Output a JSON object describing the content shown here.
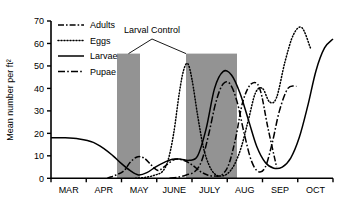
{
  "chart_data": {
    "type": "line",
    "title": "",
    "xlabel": "",
    "ylabel": "Mean number per ft²",
    "ylim": [
      0,
      70
    ],
    "yticks": [
      0,
      10,
      20,
      30,
      40,
      50,
      60,
      70
    ],
    "ytick_labels": [
      "0",
      "10",
      "20",
      "30",
      "40",
      "50",
      "60",
      "70"
    ],
    "categories": [
      "MAR",
      "APR",
      "MAY",
      "JUNE",
      "JULY",
      "AUG",
      "SEP",
      "OCT"
    ],
    "xtick_labels": [
      "MAR",
      "APR",
      "MAY",
      "JUNE",
      "JULY",
      "AUG",
      "SEP",
      "OCT"
    ],
    "grid": false,
    "legend_position": "top-left",
    "legend": [
      "Adults",
      "Eggs",
      "Larvae",
      "Pupae"
    ],
    "annotations": [
      {
        "text": "Larval Control",
        "x": "MAY-JUNE boundary",
        "y": 65
      }
    ],
    "shaded_regions": [
      {
        "label": "Larval Control application 1",
        "x_start": "MAY",
        "x_end": "late MAY",
        "y_top": 57,
        "color": "#939393"
      },
      {
        "label": "Larval Control application 2",
        "x_start": "late JUNE",
        "x_end": "late JULY",
        "y_top": 57,
        "color": "#939393"
      }
    ],
    "series": [
      {
        "name": "Adults",
        "style": "dash-dot",
        "color": "#000000",
        "x": [
          2.0,
          2.55,
          2.8,
          3.05,
          3.3,
          3.55,
          3.8,
          4.1,
          4.4,
          4.7,
          5.0,
          5.3,
          5.55,
          5.8,
          6.05,
          6.3,
          6.55,
          6.8,
          7.1,
          7.4,
          7.7,
          8.0
        ],
        "values": [
          0,
          3,
          7,
          9.5,
          9,
          6,
          3.5,
          6,
          8.5,
          8,
          6,
          3,
          1.5,
          1,
          1.5,
          6,
          18,
          34,
          42,
          40,
          22,
          5
        ]
      },
      {
        "name": "Eggs",
        "style": "dotted",
        "color": "#000000",
        "x": [
          3.0,
          3.4,
          3.7,
          3.95,
          4.15,
          4.35,
          4.55,
          4.7,
          4.85,
          5.0,
          5.2,
          5.4,
          5.6,
          5.8,
          6.0,
          6.25,
          6.5,
          6.75,
          7.0,
          7.25,
          7.5,
          7.75,
          8.0,
          8.3,
          8.6,
          8.9,
          9.2
        ],
        "values": [
          0,
          0.5,
          1.5,
          3,
          8,
          20,
          38,
          48,
          51,
          44,
          28,
          14,
          6,
          2,
          1,
          2,
          6,
          14,
          26,
          38,
          40,
          34,
          36,
          52,
          64,
          67,
          58
        ]
      },
      {
        "name": "Larvae",
        "style": "solid",
        "color": "#000000",
        "x": [
          0.0,
          0.5,
          1.0,
          1.5,
          1.9,
          2.2,
          2.5,
          2.8,
          3.1,
          3.4,
          3.7,
          4.0,
          4.3,
          4.6,
          4.9,
          5.2,
          5.5,
          5.8,
          6.1,
          6.4,
          6.7,
          7.0,
          7.3,
          7.6,
          7.9,
          8.2,
          8.5,
          8.8,
          9.1,
          9.4,
          9.7,
          10.0
        ],
        "values": [
          18,
          18,
          17.5,
          16,
          13,
          10,
          6.5,
          3.5,
          1.5,
          2.5,
          5,
          7,
          8.5,
          8.5,
          8,
          10,
          22,
          40,
          47.5,
          46,
          38,
          26,
          14,
          7,
          4.5,
          5,
          9,
          18,
          32,
          48,
          58,
          62
        ]
      },
      {
        "name": "Pupae",
        "style": "dash-dot-long",
        "color": "#000000",
        "x": [
          4.2,
          4.5,
          4.8,
          5.1,
          5.35,
          5.6,
          5.85,
          6.1,
          6.35,
          6.6,
          6.85,
          7.1,
          7.35,
          7.6,
          7.85,
          8.1,
          8.4,
          8.7
        ],
        "values": [
          0,
          0.5,
          1.5,
          3,
          8,
          20,
          34,
          42,
          42,
          34,
          20,
          8,
          3,
          5,
          16,
          30,
          40,
          41
        ]
      }
    ]
  },
  "legend": {
    "items": [
      {
        "label": "Adults",
        "dash": "dash-dot"
      },
      {
        "label": "Eggs",
        "dash": "dotted"
      },
      {
        "label": "Larvae",
        "dash": "solid"
      },
      {
        "label": "Pupae",
        "dash": "dash-dot"
      }
    ]
  },
  "annotation": {
    "larval_control_label": "Larval Control"
  },
  "axes": {
    "y_title": "Mean number per ft²",
    "y_ticks": [
      "70",
      "60",
      "50",
      "40",
      "30",
      "20",
      "10",
      "0"
    ],
    "x_ticks": [
      "MAR",
      "APR",
      "MAY",
      "JUNE",
      "JULY",
      "AUG",
      "SEP",
      "OCT"
    ]
  },
  "colors": {
    "shade": "#939393",
    "line": "#000000",
    "axis": "#000000",
    "background": "#ffffff"
  }
}
